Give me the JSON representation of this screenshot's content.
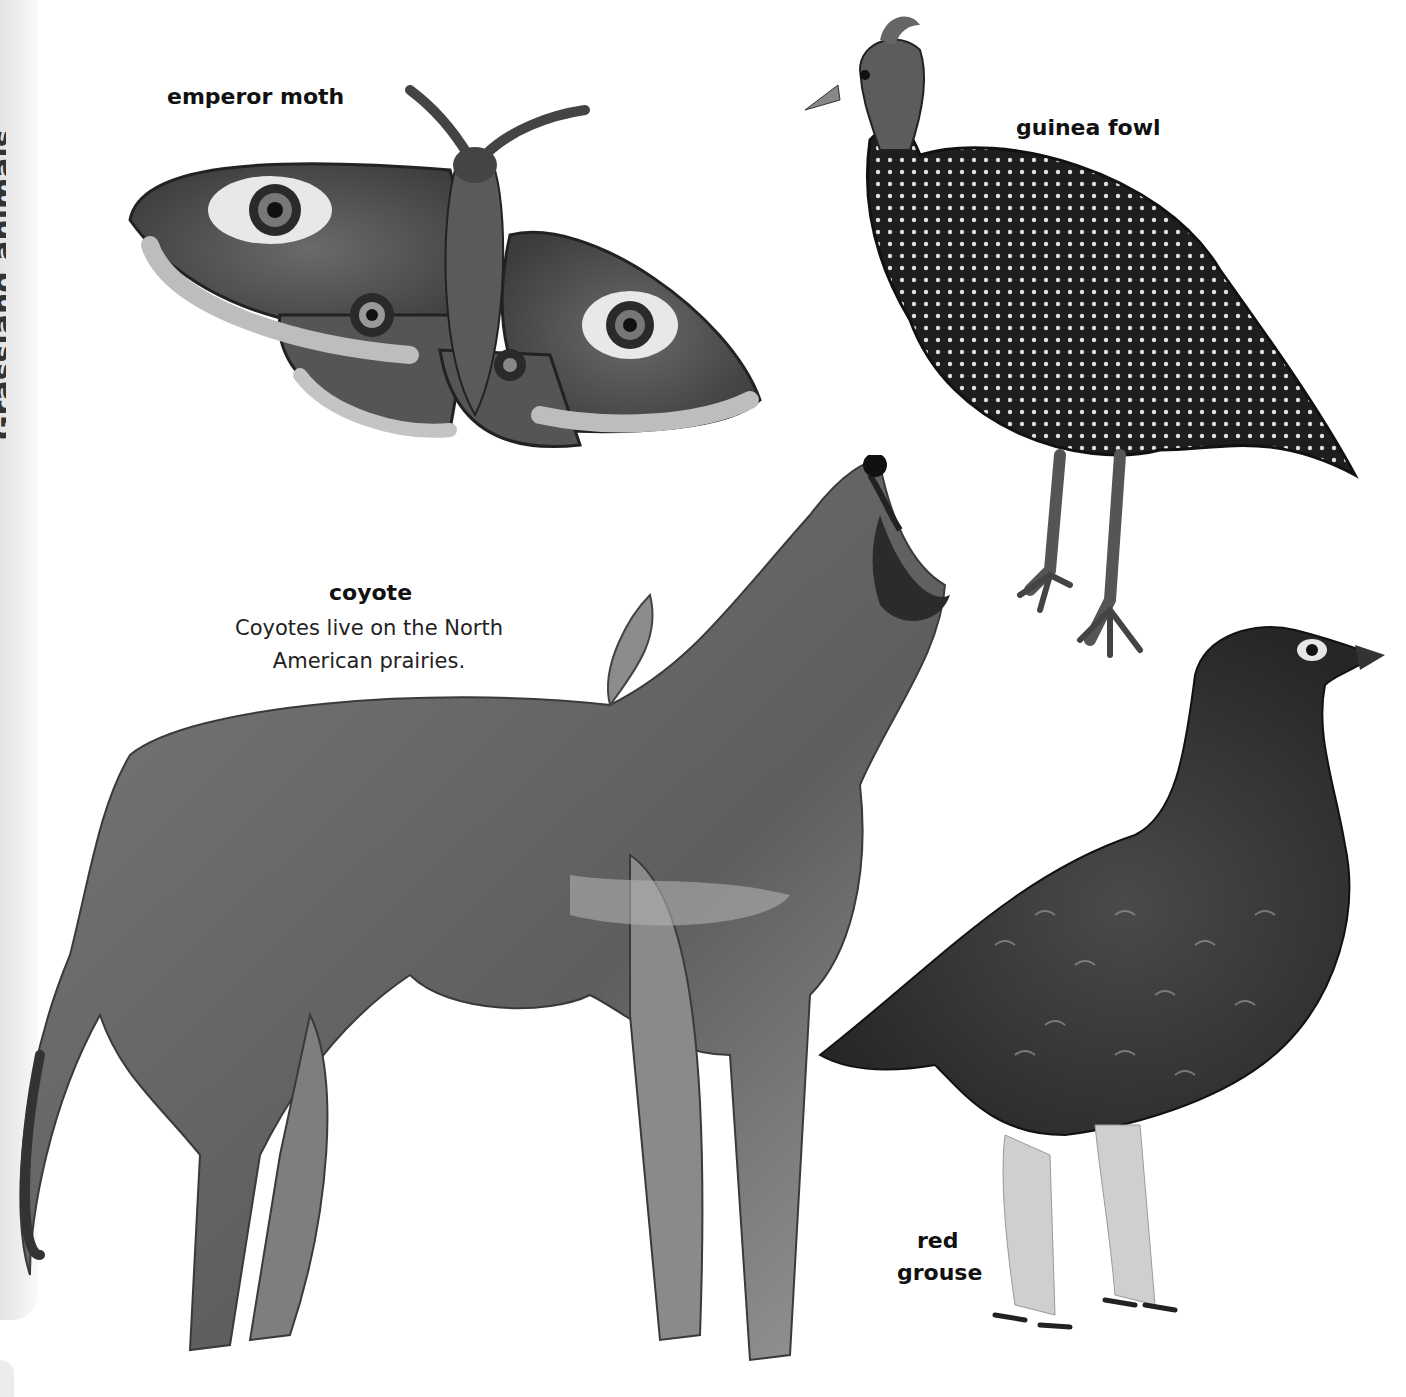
{
  "side_panel": {
    "clipped_title": "Grassland animals"
  },
  "animals": {
    "emperor_moth": {
      "label": "emperor moth"
    },
    "guinea_fowl": {
      "label": "guinea fowl"
    },
    "coyote": {
      "label": "coyote",
      "caption_line1": "Coyotes live on the North",
      "caption_line2": "American prairies."
    },
    "red_grouse": {
      "label_line1": "red",
      "label_line2": "grouse"
    }
  },
  "colors": {
    "background": "#ffffff",
    "ink": "#111111",
    "panel": "#ececec"
  }
}
